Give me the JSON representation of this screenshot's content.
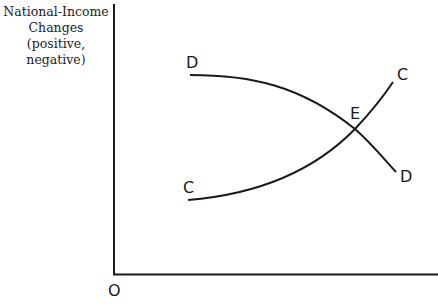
{
  "diagram": {
    "y_axis_label_lines": [
      "National-Income",
      "Changes",
      "(positive,",
      "negative)"
    ],
    "origin_label": "O",
    "curves": [
      {
        "name": "DD",
        "start_label": "D",
        "end_label": "D",
        "shape": "downward-sloping, concave"
      },
      {
        "name": "CC",
        "start_label": "C",
        "end_label": "C",
        "shape": "upward-sloping, convex"
      }
    ],
    "intersection_label": "E",
    "colors": {
      "line": "#1a1a1a",
      "background": "#ffffff"
    }
  }
}
